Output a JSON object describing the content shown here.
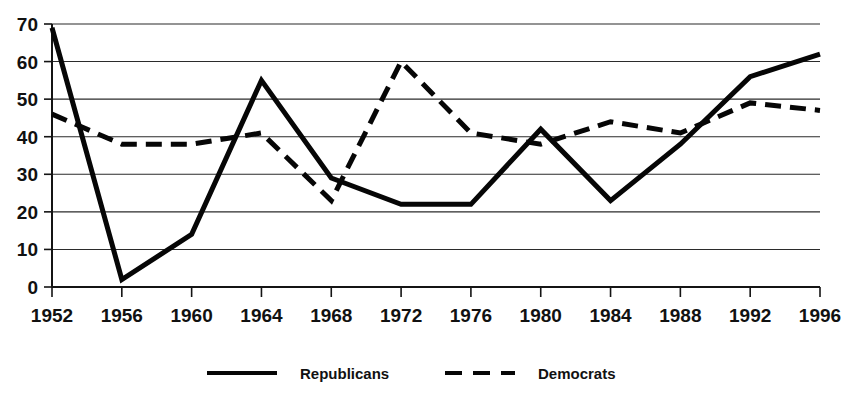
{
  "chart_data": {
    "type": "line",
    "title": "",
    "subtitle": "",
    "xlabel": "",
    "ylabel": "",
    "x": [
      1952,
      1956,
      1960,
      1964,
      1968,
      1972,
      1976,
      1980,
      1984,
      1988,
      1992,
      1996
    ],
    "categories": [
      "1952",
      "1956",
      "1960",
      "1964",
      "1968",
      "1972",
      "1976",
      "1980",
      "1984",
      "1988",
      "1992",
      "1996"
    ],
    "series": [
      {
        "name": "Republicans",
        "style": "solid",
        "color": "#060606",
        "values": [
          69,
          2,
          14,
          55,
          29,
          22,
          22,
          42,
          23,
          38,
          56,
          62
        ]
      },
      {
        "name": "Democrats",
        "style": "dashed",
        "color": "#060606",
        "values": [
          46,
          38,
          38,
          41,
          23,
          60,
          41,
          38,
          44,
          41,
          49,
          47
        ]
      }
    ],
    "xlim": [
      1952,
      1996
    ],
    "ylim": [
      0,
      70
    ],
    "yticks": [
      0,
      10,
      20,
      30,
      40,
      50,
      60,
      70
    ],
    "ytick_labels": [
      "0",
      "10",
      "20",
      "30",
      "40",
      "50",
      "60",
      "70"
    ],
    "xticks": [
      1952,
      1956,
      1960,
      1964,
      1968,
      1972,
      1976,
      1980,
      1984,
      1988,
      1992,
      1996
    ],
    "xtick_labels": [
      "1952",
      "1956",
      "1960",
      "1964",
      "1968",
      "1972",
      "1976",
      "1980",
      "1984",
      "1988",
      "1992",
      "1996"
    ],
    "grid": "horizontal",
    "legend_position": "bottom-center",
    "legend": [
      {
        "label": "Republicans",
        "style": "solid"
      },
      {
        "label": "Democrats",
        "style": "dashed"
      }
    ]
  }
}
